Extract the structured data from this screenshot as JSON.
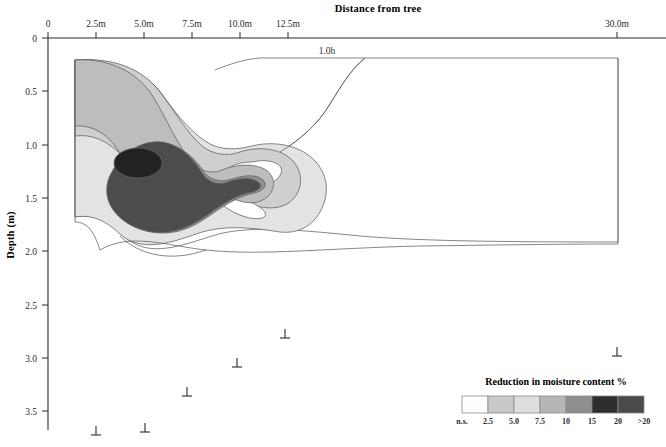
{
  "figure": {
    "top_axis_title": "Distance from tree",
    "y_axis_title": "Depth (m)",
    "inline_annotation": "1.0h"
  },
  "x_axis": {
    "unit": "m",
    "origin_label": "0",
    "tick_labels": [
      "0",
      "2.5m",
      "5.0m",
      "7.5m",
      "10.0m",
      "12.5m",
      "30.0m"
    ],
    "tick_values": [
      0,
      2.5,
      5.0,
      7.5,
      10.0,
      12.5,
      30.0
    ],
    "tick_px": [
      48,
      96,
      144,
      192,
      240,
      288,
      617
    ]
  },
  "y_axis": {
    "unit": "m",
    "tick_labels": [
      "0",
      "0.5",
      "1.0",
      "1.5",
      "2.0",
      "2.5",
      "3.0",
      "3.5"
    ],
    "tick_values": [
      0,
      0.5,
      1.0,
      1.5,
      2.0,
      2.5,
      3.0,
      3.5
    ],
    "tick_px": [
      38,
      91,
      145,
      198,
      251,
      305,
      358,
      411
    ]
  },
  "legend": {
    "title": "Reduction in moisture content %",
    "tick_labels": [
      "n.s.",
      "2.5",
      "5.0",
      "7.5",
      "10",
      "15",
      "20",
      ">20"
    ],
    "swatch_colors": [
      "#fdfdfd",
      "#c9c9c9",
      "#dedede",
      "#b6b6b6",
      "#8e8e8e",
      "#2e2e2e",
      "#4a4a4a"
    ],
    "band_labels": [
      "n.s.",
      "2.5",
      "5.0",
      "7.5",
      "10",
      "15",
      "20",
      ">20"
    ]
  },
  "probes": {
    "name": "access-tube-marker",
    "symbol": "perpendicular",
    "points": [
      {
        "x_px": 96,
        "y_px": 435
      },
      {
        "x_px": 145,
        "y_px": 432
      },
      {
        "x_px": 187,
        "y_px": 396
      },
      {
        "x_px": 237,
        "y_px": 367
      },
      {
        "x_px": 285,
        "y_px": 338
      },
      {
        "x_px": 617,
        "y_px": 356
      }
    ]
  },
  "chart_data": {
    "type": "heatmap",
    "title": "Reduction in moisture content %",
    "xlabel": "Distance from tree",
    "ylabel": "Depth (m)",
    "xlim": [
      0,
      30.0
    ],
    "ylim": [
      0,
      3.5
    ],
    "y_inverted": true,
    "grid": false,
    "legend_position": "bottom-right",
    "contour_levels": [
      2.5,
      5.0,
      7.5,
      10,
      15,
      20
    ],
    "level_labels": [
      "n.s.",
      "2.5",
      "5.0",
      "7.5",
      "10",
      "15",
      "20",
      ">20"
    ],
    "annotations": [
      {
        "text": "1.0h",
        "x_m": 6.6,
        "depth_m": 0.15
      }
    ],
    "peak": {
      "x_m": 4.2,
      "depth_m": 1.25,
      "value": ">20"
    },
    "series": [
      {
        "name": "n.s.",
        "level": 0,
        "color": "#fdfdfd"
      },
      {
        "name": "2.5",
        "level": 2.5,
        "color": "#dedede"
      },
      {
        "name": "5.0",
        "level": 5.0,
        "color": "#c9c9c9"
      },
      {
        "name": "7.5",
        "level": 7.5,
        "color": "#b6b6b6"
      },
      {
        "name": "10",
        "level": 10,
        "color": "#8e8e8e"
      },
      {
        "name": "15",
        "level": 15,
        "color": "#4a4a4a"
      },
      {
        "name": "20",
        "level": 20,
        "color": "#2e2e2e"
      }
    ]
  }
}
